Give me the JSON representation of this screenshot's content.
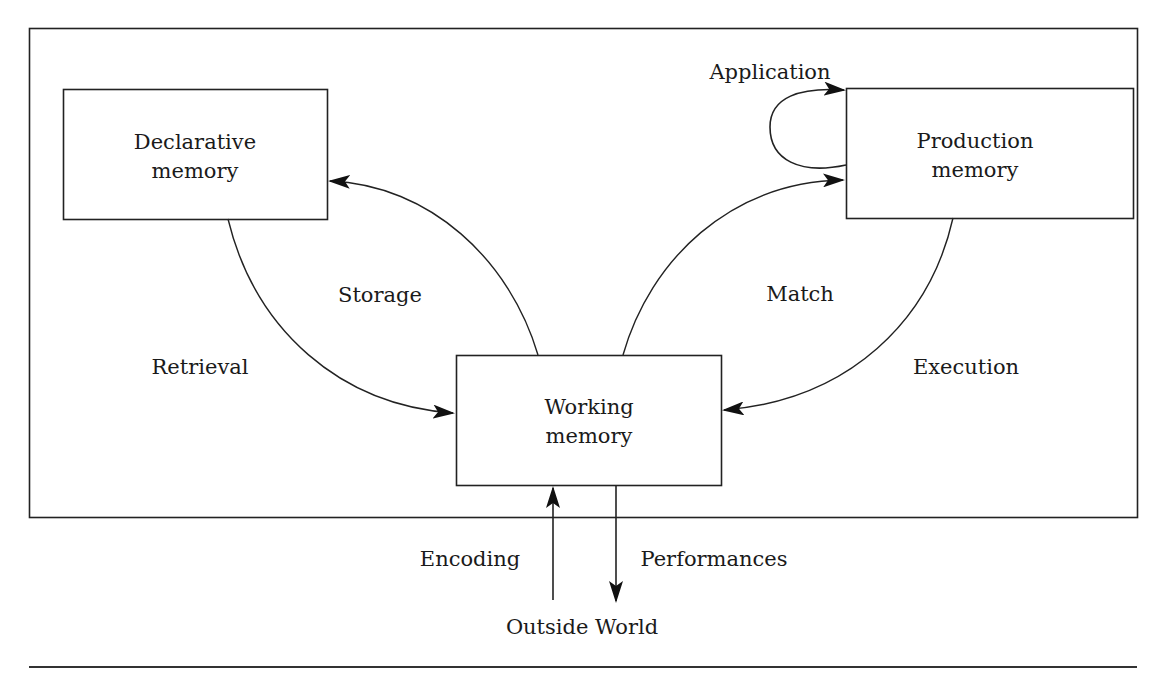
{
  "diagram": {
    "type": "memory-architecture-flow",
    "boxes": {
      "declarative": {
        "line1": "Declarative",
        "line2": "memory"
      },
      "production": {
        "line1": "Production",
        "line2": "memory"
      },
      "working": {
        "line1": "Working",
        "line2": "memory"
      }
    },
    "edges": {
      "application": "Application",
      "storage": "Storage",
      "retrieval": "Retrieval",
      "match": "Match",
      "execution": "Execution",
      "encoding": "Encoding",
      "performances": "Performances"
    },
    "external": {
      "outside_world": "Outside World"
    },
    "connections": [
      {
        "from": "production",
        "to": "production",
        "label": "Application"
      },
      {
        "from": "working",
        "to": "declarative",
        "label": "Storage"
      },
      {
        "from": "declarative",
        "to": "working",
        "label": "Retrieval"
      },
      {
        "from": "working",
        "to": "production",
        "label": "Match"
      },
      {
        "from": "production",
        "to": "working",
        "label": "Execution"
      },
      {
        "from": "outside_world",
        "to": "working",
        "label": "Encoding"
      },
      {
        "from": "working",
        "to": "outside_world",
        "label": "Performances"
      }
    ],
    "colors": {
      "ink": "#222222",
      "background": "#ffffff"
    }
  }
}
